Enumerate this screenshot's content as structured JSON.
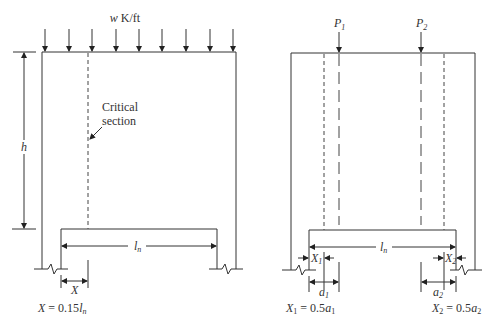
{
  "left_diagram": {
    "load_label_var": "w",
    "load_label_unit": " K/ft",
    "critical_label_line1": "Critical",
    "critical_label_line2": "section",
    "height_label": "h",
    "span_label_main": "l",
    "span_label_sub": "n",
    "x_dim_label": "X",
    "formula_lhs": "X",
    "formula_rhs_coef": " = 0.15",
    "formula_rhs_var": "l",
    "formula_rhs_sub": "n"
  },
  "right_diagram": {
    "p1_main": "P",
    "p1_sub": "1",
    "p2_main": "P",
    "p2_sub": "2",
    "span_label_main": "l",
    "span_label_sub": "n",
    "x1_main": "X",
    "x1_sub": "1",
    "x2_main": "X",
    "x2_sub": "2",
    "a1_main": "a",
    "a1_sub": "1",
    "a2_main": "a",
    "a2_sub": "2",
    "formula1_lhs": "X",
    "formula1_lhs_sub": "1",
    "formula1_mid": " = 0.5",
    "formula1_var": "a",
    "formula1_var_sub": "1",
    "formula2_lhs": "X",
    "formula2_lhs_sub": "2",
    "formula2_mid": " = 0.5",
    "formula2_var": "a",
    "formula2_var_sub": "2"
  }
}
